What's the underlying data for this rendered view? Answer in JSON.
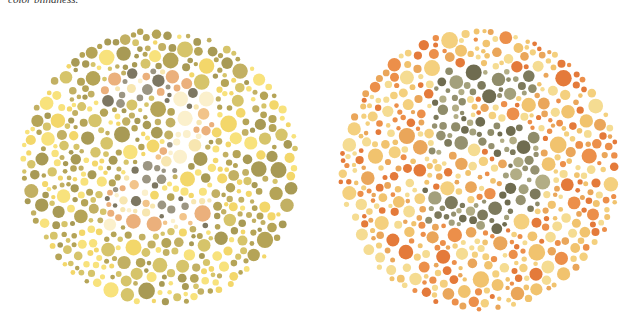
{
  "caption": "color blindness.",
  "plates": [
    {
      "id": "left",
      "hidden_number": "2",
      "palette": {
        "background": [
          "#b5a457",
          "#c2b063",
          "#a89a55",
          "#f3d76a",
          "#f8e27c",
          "#d6c46a"
        ],
        "figure": [
          "#fbf0cc",
          "#f7e6b0",
          "#f2c48a",
          "#ebb07c",
          "#7d7762",
          "#9b9582"
        ]
      }
    },
    {
      "id": "right",
      "hidden_number": "5",
      "palette": {
        "background": [
          "#e47a3a",
          "#ec8f4a",
          "#f1c36e",
          "#f4d07e",
          "#eaa65a",
          "#f5dc92"
        ],
        "figure": [
          "#7d7a5c",
          "#8f8c6a",
          "#a3a07c",
          "#6f6c50",
          "#b2ad85",
          "#959170"
        ]
      }
    }
  ]
}
